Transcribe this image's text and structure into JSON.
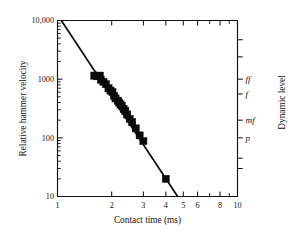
{
  "chart_data": {
    "type": "scatter",
    "title": "",
    "xlabel": "Contact time (ms)",
    "ylabel": "Relative hammer velocity",
    "y2label": "Dynamic level",
    "xscale": "log",
    "yscale": "log",
    "xlim": [
      1,
      10
    ],
    "ylim": [
      10,
      10000
    ],
    "grid": false,
    "legend": null,
    "xticks": [
      1,
      2,
      3,
      4,
      5,
      6,
      8,
      10
    ],
    "xticklabels": [
      "1",
      "2",
      "3",
      "4",
      "5",
      "6",
      "8",
      "10"
    ],
    "yticks": [
      10,
      100,
      1000,
      10000
    ],
    "yticklabels": [
      "10",
      "100",
      "1000",
      "10,000"
    ],
    "x": [
      1.6,
      1.66,
      1.72,
      1.74,
      1.8,
      1.86,
      1.92,
      1.97,
      2.02,
      2.06,
      2.1,
      2.16,
      2.2,
      2.24,
      2.28,
      2.33,
      2.38,
      2.44,
      2.52,
      2.6,
      2.72,
      2.86,
      3.0,
      4.0
    ],
    "y": [
      1150,
      1120,
      1150,
      980,
      900,
      820,
      700,
      640,
      600,
      520,
      470,
      430,
      400,
      370,
      350,
      310,
      290,
      250,
      210,
      185,
      145,
      110,
      88,
      20
    ],
    "marker": "square",
    "fit_line": {
      "label": "power-law fit",
      "x": [
        1.05,
        4.65
      ],
      "y": [
        10000,
        10
      ]
    },
    "y2_ticks": [
      {
        "label": "ff",
        "y": 1000
      },
      {
        "label": "f",
        "y": 560
      },
      {
        "label": "mf",
        "y": 200
      },
      {
        "label": "p",
        "y": 100
      }
    ]
  }
}
